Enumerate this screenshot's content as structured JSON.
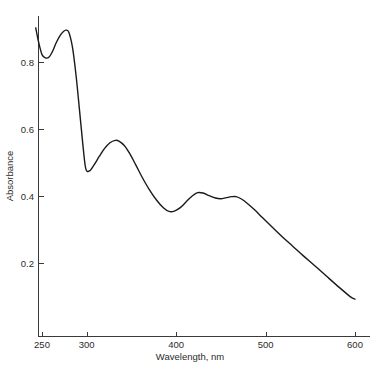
{
  "chart_data": {
    "type": "line",
    "title": "",
    "xlabel": "Wavelength, nm",
    "ylabel": "Absorbance",
    "xlim": [
      242,
      600
    ],
    "ylim": [
      0.0,
      0.95
    ],
    "xticks": [
      250,
      300,
      400,
      500,
      600
    ],
    "xtick_labels": [
      "250",
      "300",
      "400",
      "500",
      "600"
    ],
    "yticks": [
      0.2,
      0.4,
      0.6,
      0.8
    ],
    "ytick_labels": [
      "0.2",
      "0.4",
      "0.6",
      "0.8"
    ],
    "grid": false,
    "legend": null,
    "line_color": "#1a1a1a",
    "axis_color": "#3a3a3a",
    "series": [
      {
        "name": "Absorbance spectrum",
        "x": [
          243,
          246,
          250,
          254,
          258,
          262,
          266,
          270,
          274,
          277,
          280,
          284,
          288,
          292,
          296,
          299,
          303,
          308,
          314,
          320,
          326,
          332,
          336,
          342,
          348,
          355,
          362,
          370,
          378,
          386,
          392,
          398,
          405,
          412,
          418,
          424,
          430,
          437,
          444,
          450,
          456,
          462,
          467,
          473,
          480,
          488,
          497,
          507,
          518,
          530,
          542,
          555,
          568,
          582,
          595,
          600
        ],
        "y": [
          0.902,
          0.862,
          0.822,
          0.812,
          0.815,
          0.833,
          0.858,
          0.878,
          0.891,
          0.895,
          0.889,
          0.845,
          0.762,
          0.655,
          0.545,
          0.481,
          0.475,
          0.492,
          0.518,
          0.542,
          0.559,
          0.566,
          0.564,
          0.551,
          0.527,
          0.492,
          0.456,
          0.419,
          0.388,
          0.364,
          0.354,
          0.355,
          0.366,
          0.385,
          0.4,
          0.41,
          0.409,
          0.401,
          0.394,
          0.392,
          0.395,
          0.398,
          0.398,
          0.391,
          0.377,
          0.358,
          0.334,
          0.308,
          0.28,
          0.251,
          0.222,
          0.192,
          0.161,
          0.128,
          0.099,
          0.092
        ]
      }
    ],
    "annotations": {
      "peak_1_nm": 277,
      "peak_1_abs": 0.895,
      "peak_2_nm": 333,
      "peak_2_abs": 0.566,
      "peak_3_nm": 424,
      "peak_3_abs": 0.41,
      "peak_4_nm": 464,
      "peak_4_abs": 0.398,
      "valley_1_nm": 255,
      "valley_1_abs": 0.812,
      "valley_2_nm": 301,
      "valley_2_abs": 0.475,
      "valley_3_nm": 392,
      "valley_3_abs": 0.354
    }
  }
}
